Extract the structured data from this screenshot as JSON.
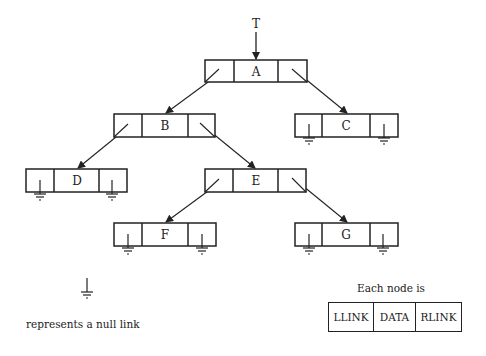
{
  "root_pointer": {
    "label": "T"
  },
  "nodes": {
    "A": {
      "data": "A",
      "left": "B",
      "right": "C"
    },
    "B": {
      "data": "B",
      "left": "D",
      "right": "E"
    },
    "C": {
      "data": "C",
      "left": null,
      "right": null
    },
    "D": {
      "data": "D",
      "left": null,
      "right": null
    },
    "E": {
      "data": "E",
      "left": "F",
      "right": "G"
    },
    "F": {
      "data": "F",
      "left": null,
      "right": null
    },
    "G": {
      "data": "G",
      "left": null,
      "right": null
    }
  },
  "legend": {
    "null_link_caption": "represents a null link",
    "node_caption": "Each node is",
    "fields": [
      "LLINK",
      "DATA",
      "RLINK"
    ]
  },
  "colors": {
    "line": "#222222",
    "background": "#ffffff"
  }
}
